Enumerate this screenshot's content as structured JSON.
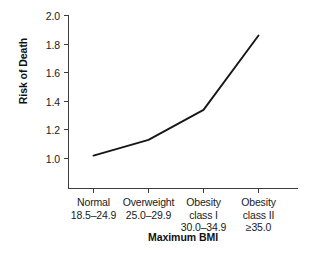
{
  "chart_data": {
    "type": "line",
    "title": "",
    "xlabel": "Maximum BMI",
    "ylabel": "Risk of Death",
    "categories": [
      "Normal\n18.5–24.9",
      "Overweight\n25.0–29.9",
      "Obesity\nclass I\n30.0–34.9",
      "Obesity\nclass II\n≥35.0"
    ],
    "category_lines": [
      [
        "Normal",
        "18.5–24.9"
      ],
      [
        "Overweight",
        "25.0–29.9"
      ],
      [
        "Obesity",
        "class I",
        "30.0–34.9"
      ],
      [
        "Obesity",
        "class II",
        "≥35.0"
      ]
    ],
    "values": [
      1.02,
      1.13,
      1.34,
      1.86
    ],
    "ylim": [
      0.9,
      2.0
    ],
    "yticks": [
      1.0,
      1.2,
      1.4,
      1.6,
      1.8,
      2.0
    ],
    "ytick_labels": [
      "1.0",
      "1.2",
      "1.4",
      "1.6",
      "1.8",
      "2.0"
    ],
    "grid": false,
    "legend": null,
    "series": [
      {
        "name": "Risk of Death",
        "values": [
          1.02,
          1.13,
          1.34,
          1.86
        ],
        "color": "#17171a"
      }
    ]
  },
  "colors": {
    "line": "#17171a",
    "axis": "#3c3c3c",
    "text": "#1a1a1a",
    "background": "#ffffff"
  }
}
